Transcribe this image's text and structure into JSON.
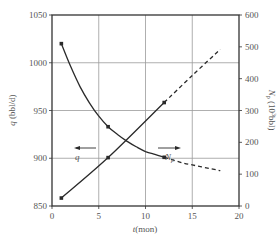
{
  "chart_data": {
    "type": "line",
    "title": "",
    "xlabel": "t(mon)",
    "ylabel_left": "q (bbl/d)",
    "ylabel_right": "N_p (10^3 bbl)",
    "xlim": [
      0,
      20
    ],
    "ylim_left": [
      850,
      1050
    ],
    "ylim_right": [
      0,
      600
    ],
    "x_ticks": [
      0,
      5,
      10,
      15,
      20
    ],
    "y_ticks_left": [
      850,
      900,
      950,
      1000,
      1050
    ],
    "y_ticks_right": [
      0,
      100,
      200,
      300,
      400,
      500,
      600
    ],
    "grid": true,
    "legend": "inline arrow annotations",
    "series": [
      {
        "name": "q",
        "axis": "left",
        "style": "solid then dashed (forecast)",
        "markers": [
          {
            "t": 1,
            "value": 1020
          },
          {
            "t": 6,
            "value": 933
          },
          {
            "t": 12,
            "value": 901
          }
        ],
        "solid_curve": [
          [
            1,
            1020
          ],
          [
            2,
            996
          ],
          [
            3,
            975
          ],
          [
            4,
            958
          ],
          [
            5,
            944
          ],
          [
            6,
            933
          ],
          [
            7,
            925
          ],
          [
            8,
            918
          ],
          [
            9,
            912
          ],
          [
            10,
            907
          ],
          [
            11,
            904
          ],
          [
            12,
            901
          ]
        ],
        "dashed_curve": [
          [
            12,
            901
          ],
          [
            13,
            898
          ],
          [
            14,
            895
          ],
          [
            15,
            893
          ],
          [
            16,
            891
          ],
          [
            17,
            889
          ],
          [
            18,
            887
          ]
        ]
      },
      {
        "name": "N_p",
        "axis": "right",
        "style": "solid then dashed (forecast)",
        "markers": [
          {
            "t": 1,
            "value": 25
          },
          {
            "t": 6,
            "value": 152
          },
          {
            "t": 12,
            "value": 325
          }
        ],
        "solid_curve": [
          [
            1,
            25
          ],
          [
            6,
            152
          ],
          [
            12,
            325
          ]
        ],
        "dashed_curve": [
          [
            12,
            325
          ],
          [
            15,
            410
          ],
          [
            18,
            492
          ]
        ]
      }
    ],
    "annotations": [
      {
        "text": "q",
        "arrow": "left",
        "points_to": "left axis",
        "at_t": 2.5,
        "at_q": 943
      },
      {
        "text": "N_p",
        "arrow": "right",
        "points_to": "right axis",
        "at_t": 13,
        "at_q": 943
      }
    ]
  },
  "axes": {
    "x_label_italic": "t",
    "x_label_rest": "(mon)",
    "y_left_label_italic": "q",
    "y_left_label_rest": " (bbl/d)",
    "y_right_label_italic": "N",
    "y_right_label_sub": "p",
    "y_right_label_rest": " (10",
    "y_right_label_sup": "3",
    "y_right_label_end": "bbl)"
  },
  "labels": {
    "q_arrow": "q",
    "np_arrow_main": "N",
    "np_arrow_sub": "p"
  },
  "colors": {
    "line": "#2a2a2a",
    "grid": "#9a9a9a",
    "frame": "#333333",
    "text": "#555555"
  }
}
